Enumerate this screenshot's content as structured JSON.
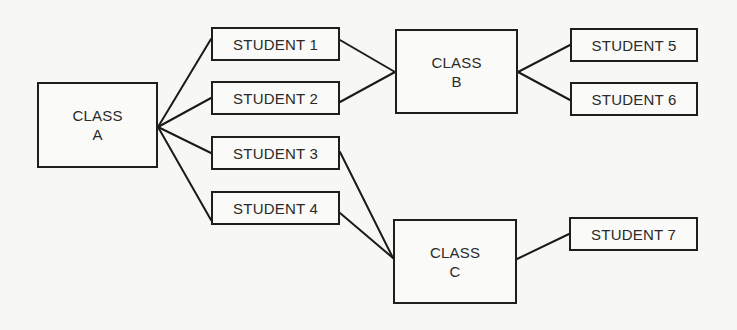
{
  "diagram": {
    "type": "tree",
    "nodes": [
      {
        "id": "class_a",
        "label": "CLASS\nA",
        "kind": "class",
        "x": 37,
        "y": 82,
        "w": 121,
        "h": 86
      },
      {
        "id": "student_1",
        "label": "STUDENT 1",
        "kind": "student",
        "x": 211,
        "y": 27,
        "w": 129,
        "h": 34
      },
      {
        "id": "student_2",
        "label": "STUDENT 2",
        "kind": "student",
        "x": 211,
        "y": 81,
        "w": 129,
        "h": 34
      },
      {
        "id": "student_3",
        "label": "STUDENT 3",
        "kind": "student",
        "x": 211,
        "y": 136,
        "w": 129,
        "h": 34
      },
      {
        "id": "student_4",
        "label": "STUDENT 4",
        "kind": "student",
        "x": 211,
        "y": 191,
        "w": 129,
        "h": 34
      },
      {
        "id": "class_b",
        "label": "CLASS\nB",
        "kind": "class",
        "x": 395,
        "y": 29,
        "w": 123,
        "h": 85
      },
      {
        "id": "class_c",
        "label": "CLASS\nC",
        "kind": "class",
        "x": 393,
        "y": 219,
        "w": 124,
        "h": 85
      },
      {
        "id": "student_5",
        "label": "STUDENT 5",
        "kind": "student",
        "x": 570,
        "y": 28,
        "w": 128,
        "h": 34
      },
      {
        "id": "student_6",
        "label": "STUDENT 6",
        "kind": "student",
        "x": 570,
        "y": 82,
        "w": 128,
        "h": 34
      },
      {
        "id": "student_7",
        "label": "STUDENT 7",
        "kind": "student",
        "x": 569,
        "y": 217,
        "w": 129,
        "h": 34
      }
    ],
    "edges": [
      {
        "from": "class_a",
        "to": "student_1",
        "x1": 158,
        "y1": 127,
        "x2": 211,
        "y2": 39
      },
      {
        "from": "class_a",
        "to": "student_2",
        "x1": 158,
        "y1": 127,
        "x2": 211,
        "y2": 98
      },
      {
        "from": "class_a",
        "to": "student_3",
        "x1": 158,
        "y1": 127,
        "x2": 211,
        "y2": 153
      },
      {
        "from": "class_a",
        "to": "student_4",
        "x1": 158,
        "y1": 127,
        "x2": 211,
        "y2": 220
      },
      {
        "from": "student_1",
        "to": "class_b",
        "x1": 340,
        "y1": 40,
        "x2": 395,
        "y2": 72
      },
      {
        "from": "student_2",
        "to": "class_b",
        "x1": 340,
        "y1": 102,
        "x2": 395,
        "y2": 72
      },
      {
        "from": "class_b",
        "to": "student_5",
        "x1": 518,
        "y1": 72,
        "x2": 570,
        "y2": 45
      },
      {
        "from": "class_b",
        "to": "student_6",
        "x1": 518,
        "y1": 72,
        "x2": 570,
        "y2": 100
      },
      {
        "from": "student_3",
        "to": "class_c",
        "x1": 340,
        "y1": 152,
        "x2": 393,
        "y2": 258
      },
      {
        "from": "student_4",
        "to": "class_c",
        "x1": 340,
        "y1": 213,
        "x2": 393,
        "y2": 258
      },
      {
        "from": "class_c",
        "to": "student_7",
        "x1": 517,
        "y1": 259,
        "x2": 569,
        "y2": 234
      }
    ]
  }
}
